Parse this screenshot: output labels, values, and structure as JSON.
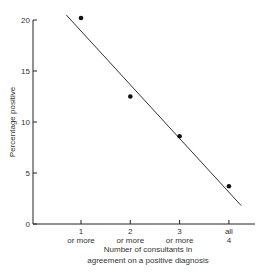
{
  "chart_data": {
    "type": "scatter",
    "title": "",
    "xlabel": "Number of consultants in agreement on a positive diagnosis",
    "xlabel_lines": [
      "Number of consultants in",
      "agreement on a positive diagnosis"
    ],
    "ylabel": "Percentage positive",
    "categories": [
      "1 or more",
      "2 or more",
      "3 or more",
      "all 4"
    ],
    "x_tick_labels": [
      [
        "1",
        "or more"
      ],
      [
        "2",
        "or more"
      ],
      [
        "3",
        "or more"
      ],
      [
        "all",
        "4"
      ]
    ],
    "values": [
      20.2,
      12.5,
      8.6,
      3.7
    ],
    "y_ticks": [
      0,
      5,
      10,
      15,
      20
    ],
    "ylim": [
      0,
      20
    ],
    "grid": false,
    "legend": null,
    "annotations": [],
    "fit_line": {
      "type": "linear",
      "from": {
        "x": 0.7,
        "y": 20.5
      },
      "to": {
        "x": 4.25,
        "y": 1.8
      }
    }
  }
}
